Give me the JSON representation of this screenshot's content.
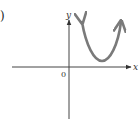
{
  "figure": {
    "panel_label": ")",
    "x_axis_label": "x",
    "y_axis_label": "y",
    "origin_label": "0",
    "curve": {
      "type": "parabola",
      "opens": "up",
      "vertex_position": "right of y-axis, above x-axis",
      "color": "#7a7a7a"
    },
    "axis_color": "#444444"
  }
}
